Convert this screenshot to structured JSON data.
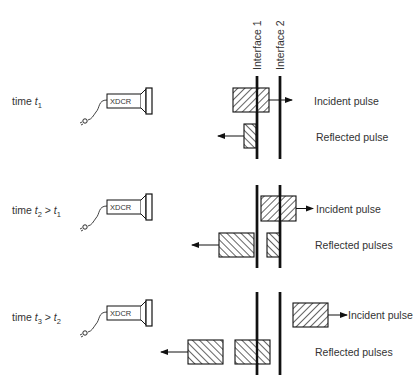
{
  "interfaces": [
    {
      "label": "Interface 1",
      "x": 257
    },
    {
      "label": "Interface 2",
      "x": 280
    }
  ],
  "transducer_label": "XDCR",
  "colors": {
    "ink": "#111111",
    "text": "#333333",
    "background": "#ffffff"
  },
  "panels": [
    {
      "time_label": {
        "prefix": "time ",
        "t": "t",
        "sub": "1",
        "rel": "",
        "t2": "",
        "sub2": ""
      },
      "label_y": 105,
      "line_y": [
        76,
        159
      ],
      "xdcr_y": 94,
      "incident": {
        "rect": [
          233,
          88,
          36,
          24
        ],
        "hatch": "back",
        "arrow_to": 292,
        "label": "Incident pulse",
        "label_x": 314,
        "label_y": 105
      },
      "reflected": [
        {
          "rect": [
            244,
            124,
            12,
            24
          ],
          "hatch": "fwd"
        }
      ],
      "reflected_arrow": {
        "from": 244,
        "to": 218,
        "y": 136
      },
      "reflected_label": {
        "text": "Reflected pulse",
        "x": 316,
        "y": 141
      }
    },
    {
      "time_label": {
        "prefix": "time ",
        "t": "t",
        "sub": "2",
        "rel": " > ",
        "t2": "t",
        "sub2": "1"
      },
      "label_y": 214,
      "line_y": [
        185,
        268
      ],
      "xdcr_y": 200,
      "incident": {
        "rect": [
          261,
          196,
          35,
          25
        ],
        "hatch": "back",
        "arrow_to": 313,
        "label": "Incident pulse",
        "label_x": 316,
        "label_y": 213
      },
      "reflected": [
        {
          "rect": [
            219,
            233,
            35,
            24
          ],
          "hatch": "fwd"
        },
        {
          "rect": [
            267,
            233,
            13,
            24
          ],
          "hatch": "fwd"
        }
      ],
      "reflected_arrow": {
        "from": 219,
        "to": 192,
        "y": 245
      },
      "reflected_label": {
        "text": "Reflected pulses",
        "x": 315,
        "y": 249
      }
    },
    {
      "time_label": {
        "prefix": "time ",
        "t": "t",
        "sub": "3",
        "rel": " > ",
        "t2": "t",
        "sub2": "2"
      },
      "label_y": 321,
      "line_y": [
        292,
        375
      ],
      "xdcr_y": 306,
      "incident": {
        "rect": [
          293,
          303,
          35,
          24
        ],
        "hatch": "back",
        "arrow_to": 347,
        "label": "Incident pulse",
        "label_x": 348,
        "label_y": 319
      },
      "reflected": [
        {
          "rect": [
            188,
            340,
            35,
            24
          ],
          "hatch": "fwd"
        },
        {
          "rect": [
            235,
            340,
            35,
            24
          ],
          "hatch": "fwd"
        }
      ],
      "reflected_arrow": {
        "from": 188,
        "to": 161,
        "y": 352
      },
      "reflected_label": {
        "text": "Reflected pulses",
        "x": 315,
        "y": 356
      }
    }
  ]
}
